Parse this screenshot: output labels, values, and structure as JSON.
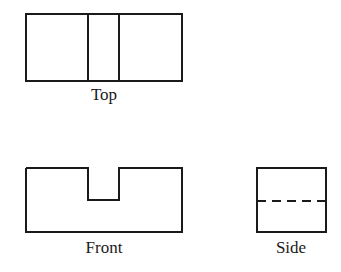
{
  "diagram": {
    "views": [
      {
        "id": "top",
        "label": "Top"
      },
      {
        "id": "front",
        "label": "Front"
      },
      {
        "id": "side",
        "label": "Side"
      }
    ],
    "stroke_color": "#1a1a1a",
    "background": "#ffffff"
  }
}
